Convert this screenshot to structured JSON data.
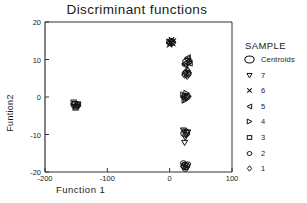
{
  "chart_data": {
    "type": "scatter",
    "title": "Discriminant functions",
    "xlabel": "Function 1",
    "ylabel": "Funtion2",
    "xlim": [
      -200,
      100
    ],
    "ylim": [
      -20,
      20
    ],
    "xticks": [
      -200,
      -100,
      0,
      100
    ],
    "yticks": [
      20,
      10,
      0,
      -10,
      -20
    ],
    "xtick_labels": [
      "-200",
      "-100",
      "0",
      "100"
    ],
    "ytick_labels": [
      "20",
      "10",
      "0",
      "-10",
      "-20"
    ],
    "grid": false,
    "legend_position": "right",
    "legend_title": "SAMPLE",
    "legend": [
      {
        "label": "Centroids",
        "marker": "circle-large"
      },
      {
        "label": "7",
        "marker": "triangle-down"
      },
      {
        "label": "6",
        "marker": "cross-x"
      },
      {
        "label": "5",
        "marker": "triangle-left"
      },
      {
        "label": "4",
        "marker": "triangle-right"
      },
      {
        "label": "3",
        "marker": "square"
      },
      {
        "label": "2",
        "marker": "circle"
      },
      {
        "label": "1",
        "marker": "diamond"
      }
    ],
    "series": [
      {
        "name": "1",
        "marker": "diamond",
        "points": [
          {
            "x": 27,
            "y": 6.2
          },
          {
            "x": 30,
            "y": 6.0
          },
          {
            "x": 24,
            "y": 5.8
          },
          {
            "x": 28,
            "y": 5.5
          },
          {
            "x": 31,
            "y": 6.5
          },
          {
            "x": 26,
            "y": 6.8
          },
          {
            "x": 29,
            "y": 7.1
          },
          {
            "x": 25,
            "y": 6.4
          }
        ]
      },
      {
        "name": "2",
        "marker": "circle",
        "points": [
          {
            "x": 24,
            "y": -18.0
          },
          {
            "x": 27,
            "y": -18.3
          },
          {
            "x": 22,
            "y": -17.6
          },
          {
            "x": 26,
            "y": -18.8
          },
          {
            "x": 29,
            "y": -17.9
          },
          {
            "x": 25,
            "y": -19.2
          },
          {
            "x": 23,
            "y": -18.5
          }
        ]
      },
      {
        "name": "3",
        "marker": "square",
        "points": [
          {
            "x": -152,
            "y": -1.8
          },
          {
            "x": -149,
            "y": -2.2
          },
          {
            "x": -154,
            "y": -1.4
          },
          {
            "x": -150,
            "y": -2.6
          },
          {
            "x": -147,
            "y": -1.9
          },
          {
            "x": -151,
            "y": -2.9
          }
        ]
      },
      {
        "name": "4",
        "marker": "triangle-right",
        "points": [
          {
            "x": 25,
            "y": 0.3
          },
          {
            "x": 28,
            "y": 0.0
          },
          {
            "x": 22,
            "y": 0.6
          },
          {
            "x": 26,
            "y": -0.5
          },
          {
            "x": 30,
            "y": 0.2
          },
          {
            "x": 24,
            "y": -0.9
          },
          {
            "x": 27,
            "y": 1.0
          }
        ]
      },
      {
        "name": "5",
        "marker": "triangle-left",
        "points": [
          {
            "x": 27,
            "y": 9.2
          },
          {
            "x": 30,
            "y": 9.6
          },
          {
            "x": 24,
            "y": 8.8
          },
          {
            "x": 28,
            "y": 10.1
          },
          {
            "x": 32,
            "y": 9.0
          },
          {
            "x": 25,
            "y": 8.4
          },
          {
            "x": 29,
            "y": 10.5
          }
        ]
      },
      {
        "name": "6",
        "marker": "cross-x",
        "points": [
          {
            "x": 2,
            "y": 14.6
          },
          {
            "x": 5,
            "y": 14.2
          },
          {
            "x": -1,
            "y": 14.9
          },
          {
            "x": 3,
            "y": 15.3
          },
          {
            "x": 0,
            "y": 13.9
          },
          {
            "x": 6,
            "y": 15.0
          },
          {
            "x": 1,
            "y": 14.4
          }
        ]
      },
      {
        "name": "7",
        "marker": "triangle-down",
        "points": [
          {
            "x": 24,
            "y": -9.2
          },
          {
            "x": 27,
            "y": -9.6
          },
          {
            "x": 22,
            "y": -8.9
          },
          {
            "x": 26,
            "y": -10.2
          },
          {
            "x": 29,
            "y": -9.4
          },
          {
            "x": 25,
            "y": -10.8
          },
          {
            "x": 24,
            "y": -12.2
          }
        ]
      },
      {
        "name": "Centroids",
        "marker": "circle-large",
        "points": [
          {
            "x": 27,
            "y": 6.2
          },
          {
            "x": 25,
            "y": -18.4
          },
          {
            "x": -151,
            "y": -2.1
          },
          {
            "x": 26,
            "y": 0.1
          },
          {
            "x": 28,
            "y": 9.4
          },
          {
            "x": 2,
            "y": 14.6
          },
          {
            "x": 25,
            "y": -9.7
          }
        ]
      }
    ]
  }
}
